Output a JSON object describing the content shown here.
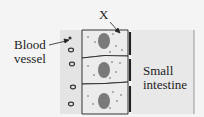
{
  "diagram": {
    "labels": {
      "x": "X",
      "blood_vessel_line1": "Blood",
      "blood_vessel_line2": "vessel",
      "small_intestine_line1": "Small",
      "small_intestine_line2": "intestine"
    },
    "cells": [
      {
        "name": "epithelial-cell-1"
      },
      {
        "name": "epithelial-cell-2"
      },
      {
        "name": "epithelial-cell-3"
      }
    ],
    "colors": {
      "background": "#f4f4f4",
      "tissue": "#e6e6e6",
      "outline": "#333333",
      "nucleus": "#777777"
    }
  }
}
